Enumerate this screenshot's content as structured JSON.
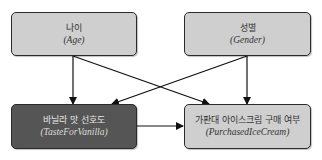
{
  "diagram": {
    "type": "causal-dag",
    "nodes": [
      {
        "id": "age",
        "label_ko": "나이",
        "label_en": "(Age)",
        "style": "light"
      },
      {
        "id": "gender",
        "label_ko": "성별",
        "label_en": "(Gender)",
        "style": "light"
      },
      {
        "id": "taste",
        "label_ko": "바닐라 맛 선호도",
        "label_en": "(TasteForVanilla)",
        "style": "dark"
      },
      {
        "id": "purchased",
        "label_ko": "가판대 아이스크림 구매 여부",
        "label_en": "(PurchasedIceCream)",
        "style": "light"
      }
    ],
    "edges": [
      {
        "from": "age",
        "to": "taste"
      },
      {
        "from": "age",
        "to": "purchased"
      },
      {
        "from": "gender",
        "to": "taste"
      },
      {
        "from": "gender",
        "to": "purchased"
      },
      {
        "from": "taste",
        "to": "purchased"
      }
    ],
    "colors": {
      "light_fill": "#cfcfcf",
      "dark_fill": "#555555",
      "border": "#2b2b2b",
      "edge": "#111111"
    }
  }
}
